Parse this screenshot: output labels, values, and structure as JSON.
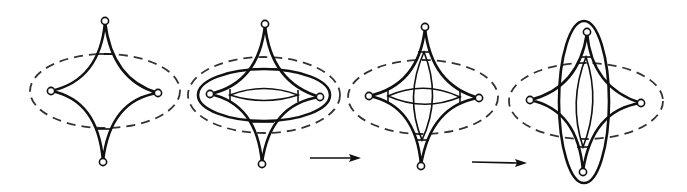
{
  "diagram": {
    "stroke_color": "#111111",
    "background": "#ffffff",
    "stages": [
      {
        "id": 1,
        "label": "astroid with dashed ellipse",
        "features": [
          "four cusps with nodes",
          "horizontal bars near top and bottom cusps",
          "dashed horizontal ellipse"
        ]
      },
      {
        "id": 2,
        "label": "astroid with horizontal lens",
        "features": [
          "solid horizontal ellipse",
          "dashed horizontal ellipse",
          "horizontal lens between side triangles",
          "bars near top and bottom cusps"
        ]
      },
      {
        "id": 3,
        "label": "astroid with crossed lenses",
        "features": [
          "horizontal lens",
          "vertical lens",
          "small triangles at cusps",
          "dashed horizontal ellipse"
        ]
      },
      {
        "id": 4,
        "label": "astroid with vertical lens",
        "features": [
          "solid vertical ellipse",
          "vertical lens",
          "dashed horizontal ellipse"
        ]
      }
    ],
    "arrows": [
      {
        "from_stage": 2,
        "to_stage": 3,
        "direction": "right"
      },
      {
        "from_stage": 3,
        "to_stage": 4,
        "direction": "right"
      }
    ]
  }
}
